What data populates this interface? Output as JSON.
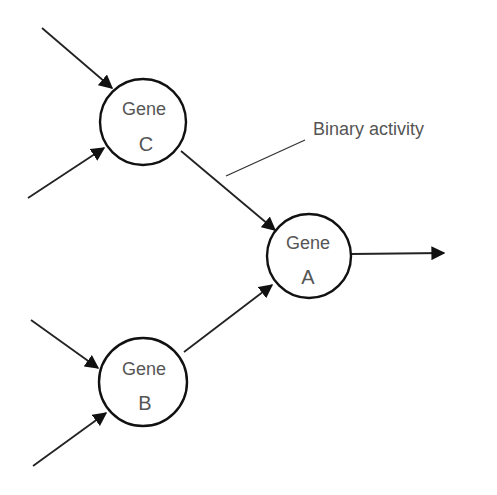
{
  "diagram": {
    "nodes": [
      {
        "id": "gene_c",
        "line1": "Gene",
        "line2": "C"
      },
      {
        "id": "gene_a",
        "line1": "Gene",
        "line2": "A"
      },
      {
        "id": "gene_b",
        "line1": "Gene",
        "line2": "B"
      }
    ],
    "annotation": "Binary activity",
    "colors": {
      "stroke": "#1a1a1a",
      "text": "#555555",
      "background": "#ffffff"
    }
  }
}
